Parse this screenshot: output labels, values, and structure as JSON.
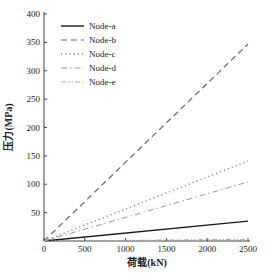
{
  "chart_data": {
    "type": "line",
    "title": "",
    "xlabel": "荷载(kN)",
    "ylabel": "压力(MPa)",
    "xlim": [
      0,
      2500
    ],
    "ylim": [
      0,
      400
    ],
    "xticks": [
      0,
      500,
      1000,
      1500,
      2000,
      2500
    ],
    "yticks": [
      50,
      100,
      150,
      200,
      250,
      300,
      350,
      400
    ],
    "xtick_labels": [
      "0",
      "500",
      "1000",
      "1500",
      "2000",
      "2500"
    ],
    "ytick_labels": [
      "50",
      "100",
      "150",
      "200",
      "250",
      "300",
      "350",
      "400"
    ],
    "grid": false,
    "legend_position": "top-left",
    "x": [
      0,
      2500
    ],
    "series": [
      {
        "name": "Node-a",
        "style": "solid",
        "color": "#1a1a1a",
        "values": [
          0,
          35
        ]
      },
      {
        "name": "Node-b",
        "style": "dashed",
        "color": "#666666",
        "values": [
          0,
          347
        ]
      },
      {
        "name": "Node-c",
        "style": "dotted",
        "color": "#888888",
        "values": [
          0,
          141
        ]
      },
      {
        "name": "Node-d",
        "style": "dashdot",
        "color": "#999999",
        "values": [
          0,
          104
        ]
      },
      {
        "name": "Node-e",
        "style": "dashdotdot",
        "color": "#aaaaaa",
        "values": [
          0,
          3
        ]
      }
    ]
  }
}
